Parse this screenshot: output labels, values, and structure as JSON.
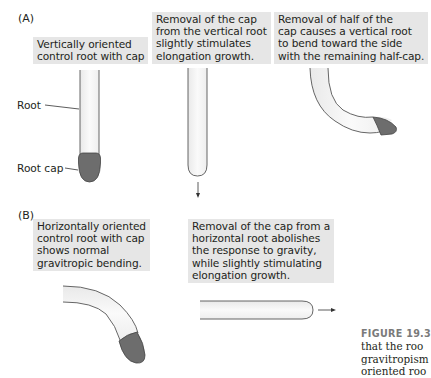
{
  "panels": {
    "A": {
      "label": "(A)",
      "captions": [
        "Vertically oriented\ncontrol root with cap",
        "Removal of the cap\nfrom the vertical root\nslightly stimulates\nelongation growth.",
        "Removal of half of the\ncap causes a vertical root\nto bend toward the side\nwith the remaining half-cap."
      ],
      "labels": {
        "root": "Root",
        "root_cap": "Root cap"
      }
    },
    "B": {
      "label": "(B)",
      "captions": [
        "Horizontally oriented\ncontrol root with cap\nshows normal\ngravitropic bending.",
        "Removal of the cap from a\nhorizontal root abolishes\nthe response to gravity,\nwhile slightly stimulating\nelongation growth."
      ]
    }
  },
  "figure_caption": {
    "number": "FIGURE 19.3",
    "lines": "that the roo\ngravitropism\noriented roo"
  },
  "colors": {
    "caption_bg": "#e6e6e6",
    "root_cap": "#6d6d6d",
    "root_outline": "#555555",
    "root_fill": "#f4f4f4"
  }
}
